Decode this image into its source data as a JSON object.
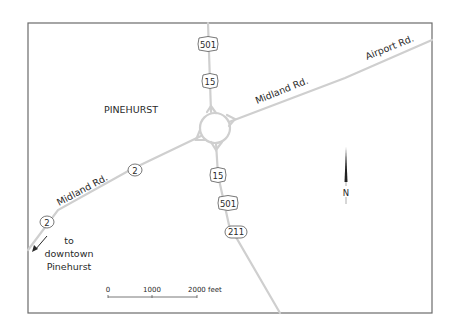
{
  "map": {
    "place_label": "PINEHURST",
    "roads": {
      "midland_east": "Midland Rd.",
      "airport": "Airport Rd.",
      "midland_west": "Midland Rd."
    },
    "shields": {
      "us501_north": "501",
      "us15_north": "15",
      "us15_south": "15",
      "us501_south": "501",
      "nc211": "211",
      "nc2_east": "2",
      "nc2_west": "2"
    },
    "direction_note": {
      "line1": "to",
      "line2": "downtown",
      "line3": "Pinehurst"
    },
    "north_arrow_label": "N",
    "scale_bar": {
      "tick0": "0",
      "tick1": "1000",
      "tick2": "2000 feet"
    },
    "colors": {
      "road": "#cfcfcf",
      "frame": "#6b6b6b",
      "text": "#2a2a2a"
    }
  }
}
